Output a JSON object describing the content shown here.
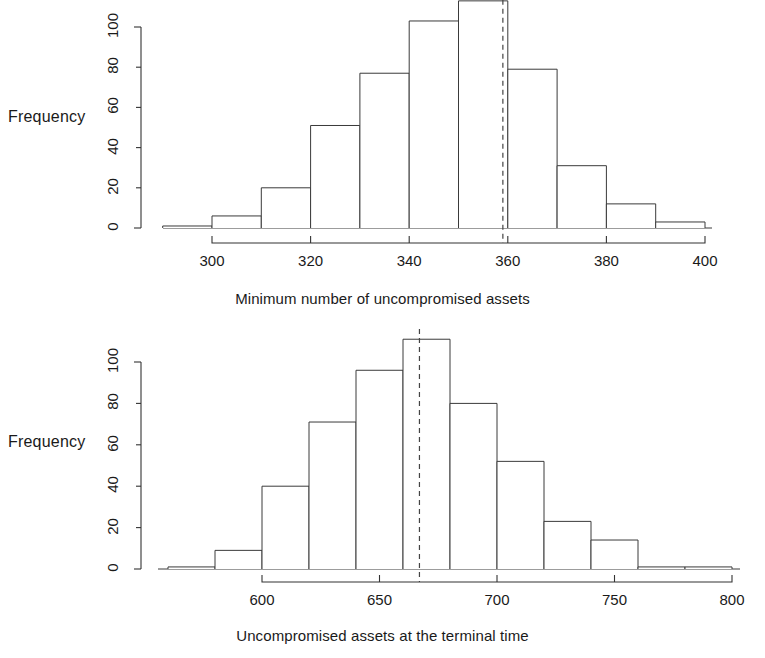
{
  "figure": {
    "background": "#ffffff",
    "ink": "#1a1a1a",
    "panel_count": 2
  },
  "chart_data": [
    {
      "type": "bar",
      "id": "minimum-uncompromised-assets-histogram",
      "title": "",
      "subtitle": "",
      "xlabel": "Minimum number of uncompromised assets",
      "ylabel": "Frequency",
      "grid": false,
      "legend": null,
      "bin_width": 10,
      "xlim": [
        290,
        400
      ],
      "ylim": [
        0,
        113
      ],
      "xticks": [
        300,
        320,
        340,
        360,
        380,
        400
      ],
      "xtick_labels": [
        "300",
        "320",
        "340",
        "360",
        "380",
        "400"
      ],
      "yticks": [
        0,
        20,
        40,
        60,
        80,
        100
      ],
      "ytick_labels": [
        "0",
        "20",
        "40",
        "60",
        "80",
        "100"
      ],
      "bin_edges": [
        290,
        300,
        310,
        320,
        330,
        340,
        350,
        360,
        370,
        380,
        390,
        400
      ],
      "categories": [
        "290-300",
        "300-310",
        "310-320",
        "320-330",
        "330-340",
        "340-350",
        "350-360",
        "360-370",
        "370-380",
        "380-390",
        "390-400"
      ],
      "values": [
        1,
        6,
        20,
        51,
        77,
        103,
        113,
        79,
        31,
        12,
        3
      ],
      "annotations": [
        {
          "kind": "vertical-dashed-line",
          "label": "mean",
          "x": 359
        }
      ]
    },
    {
      "type": "bar",
      "id": "terminal-uncompromised-assets-histogram",
      "title": "",
      "subtitle": "",
      "xlabel": "Uncompromised assets at the terminal time",
      "ylabel": "Frequency",
      "grid": false,
      "legend": null,
      "bin_width": 20,
      "xlim": [
        560,
        800
      ],
      "ylim": [
        0,
        111
      ],
      "xticks": [
        600,
        650,
        700,
        750,
        800
      ],
      "xtick_labels": [
        "600",
        "650",
        "700",
        "750",
        "800"
      ],
      "yticks": [
        0,
        20,
        40,
        60,
        80,
        100
      ],
      "ytick_labels": [
        "0",
        "20",
        "40",
        "60",
        "80",
        "100"
      ],
      "bin_edges": [
        560,
        580,
        600,
        620,
        640,
        660,
        680,
        700,
        720,
        740,
        760,
        780,
        800
      ],
      "categories": [
        "560-580",
        "580-600",
        "600-620",
        "620-640",
        "640-660",
        "660-680",
        "680-700",
        "700-720",
        "720-740",
        "740-760",
        "760-780",
        "780-800"
      ],
      "values": [
        1,
        9,
        40,
        71,
        96,
        111,
        80,
        52,
        23,
        14,
        1,
        1
      ],
      "annotations": [
        {
          "kind": "vertical-dashed-line",
          "label": "mean",
          "x": 667
        }
      ]
    }
  ]
}
